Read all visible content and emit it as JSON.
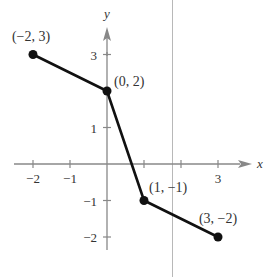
{
  "chart_data": {
    "type": "line",
    "title": "",
    "xlabel": "x",
    "ylabel": "y",
    "xlim": [
      -2.5,
      3.7
    ],
    "ylim": [
      -2.6,
      3.8
    ],
    "grid": false,
    "legend": null,
    "x_ticks": [
      -2,
      -1,
      1,
      2,
      3
    ],
    "x_tick_labels": [
      "−2",
      "−1",
      "",
      "",
      "3"
    ],
    "y_ticks": [
      -2,
      -1,
      1,
      3
    ],
    "y_tick_labels": [
      "−2",
      "−1",
      "1",
      "3"
    ],
    "series": [
      {
        "name": "piecewise linear",
        "x": [
          -2,
          0,
          1,
          3
        ],
        "y": [
          3,
          2,
          -1,
          -2
        ]
      }
    ],
    "points": [
      {
        "x": -2,
        "y": 3,
        "label": "(−2, 3)"
      },
      {
        "x": 0,
        "y": 2,
        "label": "(0, 2)"
      },
      {
        "x": 1,
        "y": -1,
        "label": "(1, −1)"
      },
      {
        "x": 3,
        "y": -2,
        "label": "(3, −2)"
      }
    ]
  },
  "colors": {
    "axis": "#888888",
    "line": "#111111",
    "artifact_line": "#b0b0b0"
  }
}
